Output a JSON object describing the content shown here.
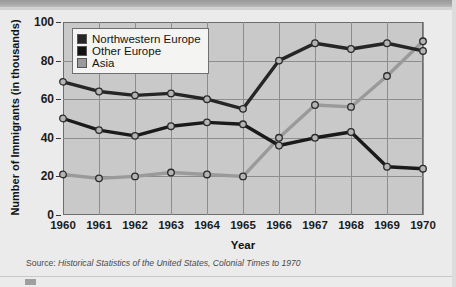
{
  "chart_data": {
    "type": "line",
    "title": "",
    "xlabel": "Year",
    "ylabel": "Number of Immigrants (in thousands)",
    "categories": [
      "1960",
      "1961",
      "1962",
      "1963",
      "1964",
      "1965",
      "1966",
      "1967",
      "1968",
      "1969",
      "1970"
    ],
    "x": [
      1960,
      1961,
      1962,
      1963,
      1964,
      1965,
      1966,
      1967,
      1968,
      1969,
      1970
    ],
    "xlim": [
      1960,
      1970
    ],
    "ylim": [
      0,
      100
    ],
    "yticks": [
      0,
      20,
      40,
      60,
      80,
      100
    ],
    "grid": true,
    "legend_position": "top-left",
    "series": [
      {
        "name": "Northwestern Europe",
        "color": "#262626",
        "values": [
          69,
          64,
          62,
          63,
          60,
          55,
          80,
          89,
          86,
          89,
          85
        ]
      },
      {
        "name": "Other Europe",
        "color": "#1a1a1a",
        "values": [
          50,
          44,
          41,
          46,
          48,
          47,
          36,
          40,
          43,
          25,
          24
        ]
      },
      {
        "name": "Asia",
        "color": "#9a9a9a",
        "values": [
          21,
          19,
          20,
          22,
          21,
          20,
          40,
          57,
          56,
          72,
          90
        ]
      }
    ]
  },
  "legend": {
    "items": [
      {
        "label": "Northwestern Europe",
        "color": "#262626"
      },
      {
        "label": "Other Europe",
        "color": "#121212"
      },
      {
        "label": "Asia",
        "color": "#9a9a9a"
      }
    ]
  },
  "axes": {
    "y_title": "Number of Immigrants (in thousands)",
    "x_title": "Year",
    "y_ticks": [
      "0",
      "20",
      "40",
      "60",
      "80",
      "100"
    ],
    "x_ticks": [
      "1960",
      "1961",
      "1962",
      "1963",
      "1964",
      "1965",
      "1966",
      "1967",
      "1968",
      "1969",
      "1970"
    ]
  },
  "source": {
    "prefix": "Source: ",
    "italic": "Historical Statistics of the United States, Colonial Times to 1970"
  },
  "marker": {
    "fill": "#b4b4b4",
    "stroke": "#2a2a2a"
  }
}
